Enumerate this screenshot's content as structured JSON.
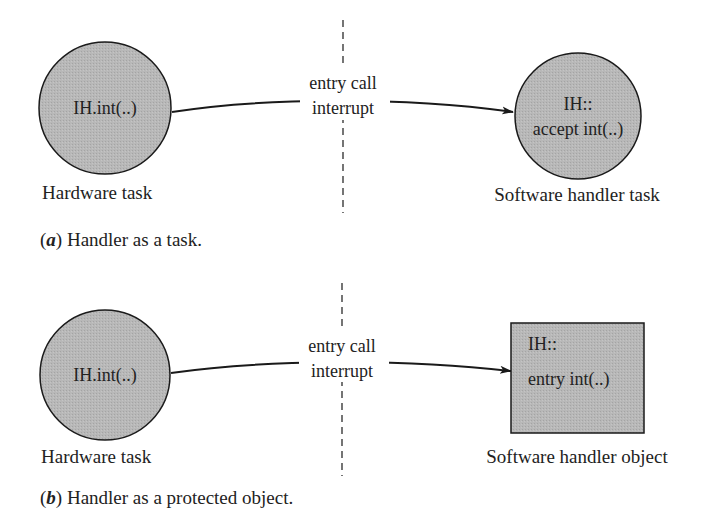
{
  "colors": {
    "node_fill": "#b3b3b3",
    "stroke": "#1a1a1a",
    "text": "#222222",
    "background": "#ffffff"
  },
  "diagram_a": {
    "source_node": {
      "shape": "circle",
      "label": "IH.int(..)",
      "caption": "Hardware task"
    },
    "target_node": {
      "shape": "circle",
      "label_line1": "IH::",
      "label_line2": "accept int(..)",
      "caption": "Software handler task"
    },
    "edge": {
      "label_line1": "entry call",
      "label_line2": "interrupt",
      "style": "curved arrow"
    },
    "separator": {
      "style": "dashed vertical line"
    },
    "caption": {
      "letter": "a",
      "open": "(",
      "close": ")",
      "text": " Handler as a task."
    }
  },
  "diagram_b": {
    "source_node": {
      "shape": "circle",
      "label": "IH.int(..)",
      "caption": "Hardware task"
    },
    "target_node": {
      "shape": "rectangle",
      "label_line1": "IH::",
      "label_line2": "entry int(..)",
      "caption": "Software handler object"
    },
    "edge": {
      "label_line1": "entry call",
      "label_line2": "interrupt",
      "style": "curved arrow"
    },
    "separator": {
      "style": "dashed vertical line"
    },
    "caption": {
      "letter": "b",
      "open": "(",
      "close": ")",
      "text": " Handler as a protected object."
    }
  }
}
